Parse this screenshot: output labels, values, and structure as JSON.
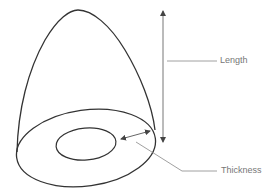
{
  "diagram": {
    "labels": {
      "length": "Length",
      "thickness": "Thickness"
    },
    "colors": {
      "shape_stroke": "#333333",
      "annotation_stroke": "#888888",
      "arrow_stroke": "#555555",
      "label_text": "#777777",
      "background": "#ffffff"
    },
    "shapes": {
      "outer_dome": "bullet-shaped shell",
      "outer_base_ellipse": "outer rim",
      "inner_base_ellipse": "inner cavity opening"
    }
  }
}
